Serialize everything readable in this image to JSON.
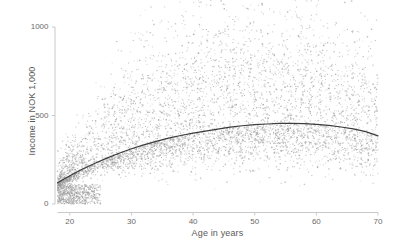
{
  "chart_data": {
    "type": "scatter",
    "title": "",
    "subtitle": "",
    "xlabel": "Age in years",
    "ylabel": "Income in NOK 1,000",
    "xlim": [
      18,
      70
    ],
    "ylim": [
      0,
      1130
    ],
    "grid": false,
    "legend": null,
    "xticks": [
      20,
      30,
      40,
      50,
      60,
      70
    ],
    "yticks": [
      0,
      500,
      1000
    ],
    "xtick_labels": [
      "20",
      "30",
      "40",
      "50",
      "60",
      "70"
    ],
    "ytick_labels": [
      "0",
      "500",
      "1000"
    ],
    "point_color": "#9a9a9a",
    "point_size": 1.1,
    "point_opacity": 0.55,
    "n_points": 6500,
    "axis_color": "#c9c9c9",
    "fit_line": {
      "label": "quadratic fit",
      "color": "#3c3c3c",
      "width": 1.2,
      "x": [
        18,
        20,
        22,
        24,
        26,
        28,
        30,
        32,
        34,
        36,
        38,
        40,
        42,
        44,
        46,
        48,
        50,
        52,
        54,
        56,
        58,
        60,
        62,
        64,
        66,
        68,
        70
      ],
      "y": [
        120,
        160,
        196,
        229,
        259,
        287,
        312,
        334,
        354,
        372,
        387,
        400,
        412,
        423,
        434,
        442,
        448,
        452,
        455,
        456,
        454,
        450,
        444,
        435,
        424,
        409,
        385
      ]
    },
    "scatter_model": {
      "description": "income scatter rising then flattening with age, heavy low-income cluster at young ages and wide upper spread in middle ages",
      "mean_x": [
        18,
        22,
        26,
        30,
        34,
        38,
        42,
        46,
        50,
        54,
        58,
        62,
        66,
        70
      ],
      "mean_y": [
        120,
        196,
        259,
        312,
        354,
        387,
        412,
        434,
        448,
        455,
        454,
        444,
        424,
        385
      ],
      "spread_low": [
        18,
        25,
        40,
        60,
        80,
        95,
        105,
        112,
        118,
        120,
        120,
        118,
        112,
        100
      ],
      "spread_high": [
        60,
        130,
        210,
        260,
        300,
        330,
        350,
        360,
        360,
        350,
        335,
        315,
        290,
        255
      ],
      "density_by_age": [
        0.9,
        1.0,
        1.0,
        1.0,
        1.0,
        1.0,
        1.0,
        1.0,
        1.0,
        1.0,
        0.95,
        0.9,
        0.85,
        0.7
      ]
    }
  },
  "figure": {
    "background": "#ffffff",
    "width": 394,
    "height": 247
  }
}
